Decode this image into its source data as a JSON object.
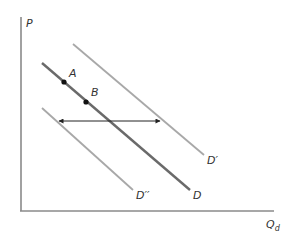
{
  "diagram": {
    "type": "demand-shift",
    "axes": {
      "y_label": "P",
      "x_label_main": "Q",
      "x_label_sub": "d",
      "color": "#8a8a8a"
    },
    "curves": [
      {
        "id": "D",
        "label": "D",
        "x1": 42,
        "y1": 63,
        "x2": 190,
        "y2": 190,
        "color": "#6a6a6a",
        "width": 2.4
      },
      {
        "id": "D_prime",
        "label": "D′",
        "x1": 73,
        "y1": 44,
        "x2": 204,
        "y2": 155,
        "color": "#a8a8a8",
        "width": 1.8
      },
      {
        "id": "D_double_prime",
        "label": "D′′",
        "x1": 42,
        "y1": 108,
        "x2": 133,
        "y2": 190,
        "color": "#a8a8a8",
        "width": 1.8
      }
    ],
    "points": [
      {
        "label": "A",
        "x": 64,
        "y": 82
      },
      {
        "label": "B",
        "x": 86,
        "y": 102
      }
    ],
    "arrow": {
      "x1": 59,
      "x2": 160,
      "y": 121,
      "direction": "both"
    }
  }
}
